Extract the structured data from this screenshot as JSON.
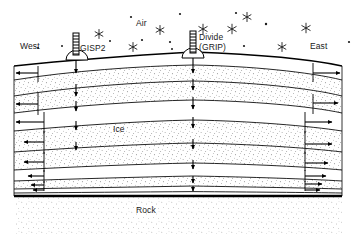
{
  "figure": {
    "kind": "glaciological-cross-section",
    "title_visible": false,
    "background_color": "#ffffff",
    "line_color": "#000000",
    "stipple_color": "#555555",
    "bed_color": "#000000",
    "width_px": 356,
    "height_px": 236
  },
  "labels": {
    "west": "West",
    "east": "East",
    "air": "Air",
    "ice": "Ice",
    "rock": "Rock",
    "gisp2": "GISP2",
    "divide_line1": "Divide",
    "divide_line2": "(GRIP)"
  },
  "drill_sites": [
    {
      "name": "GISP2",
      "label": "GISP2",
      "x": 76,
      "surface_y": 58,
      "mast_height": 22
    },
    {
      "name": "Divide (GRIP)",
      "label": "Divide\n(GRIP)",
      "x": 193,
      "surface_y": 56,
      "mast_height": 24
    }
  ],
  "chart_data": {
    "type": "diagram",
    "axes": {
      "horizontal": "West - East transect",
      "vertical": "Depth (ice thickness)"
    },
    "regions": [
      {
        "name": "Air",
        "label": "Air",
        "label_x": 143,
        "label_y": 24
      },
      {
        "name": "Ice",
        "label": "Ice",
        "label_x": 118,
        "label_y": 130
      },
      {
        "name": "Rock",
        "label": "Rock",
        "label_x": 140,
        "label_y": 211
      }
    ],
    "snowflakes": [
      {
        "x": 62,
        "y": 46,
        "size": 2.0,
        "style": "dot"
      },
      {
        "x": 99,
        "y": 34,
        "size": 4.5,
        "style": "star"
      },
      {
        "x": 131,
        "y": 17,
        "size": 2.2,
        "style": "dot"
      },
      {
        "x": 110,
        "y": 41,
        "size": 2.0,
        "style": "dot"
      },
      {
        "x": 142,
        "y": 40,
        "size": 2.2,
        "style": "dot"
      },
      {
        "x": 133,
        "y": 47,
        "size": 4.5,
        "style": "star"
      },
      {
        "x": 160,
        "y": 30,
        "size": 4.5,
        "style": "star"
      },
      {
        "x": 170,
        "y": 42,
        "size": 2.2,
        "style": "dot"
      },
      {
        "x": 172,
        "y": 49,
        "size": 2.0,
        "style": "dot"
      },
      {
        "x": 203,
        "y": 29,
        "size": 4.8,
        "style": "star"
      },
      {
        "x": 180,
        "y": 14,
        "size": 2.2,
        "style": "dot"
      },
      {
        "x": 232,
        "y": 29,
        "size": 4.8,
        "style": "star"
      },
      {
        "x": 236,
        "y": 13,
        "size": 2.2,
        "style": "dot"
      },
      {
        "x": 266,
        "y": 24,
        "size": 2.4,
        "style": "dot"
      },
      {
        "x": 244,
        "y": 46,
        "size": 2.2,
        "style": "dot"
      },
      {
        "x": 247,
        "y": 17,
        "size": 4.6,
        "style": "star"
      },
      {
        "x": 282,
        "y": 47,
        "size": 4.5,
        "style": "star"
      },
      {
        "x": 306,
        "y": 28,
        "size": 4.8,
        "style": "star"
      },
      {
        "x": 349,
        "y": 42,
        "size": 2.2,
        "style": "dot"
      },
      {
        "x": 38,
        "y": 48,
        "size": 2.2,
        "style": "dot"
      }
    ],
    "surface_profile": {
      "note": "Dome-shaped ice surface, highest at the divide",
      "points": [
        [
          14,
          66
        ],
        [
          60,
          60
        ],
        [
          110,
          56
        ],
        [
          160,
          53
        ],
        [
          193,
          52
        ],
        [
          240,
          54
        ],
        [
          290,
          58
        ],
        [
          342,
          66
        ]
      ]
    },
    "bed": {
      "note": "Flat bedrock interface drawn as a heavy black line",
      "y": 196,
      "x_start": 14,
      "x_end": 342
    },
    "isochrone_layers": [
      {
        "index": 1,
        "label": "layer-1",
        "left_y": 80,
        "mid_y": 70,
        "right_y": 80
      },
      {
        "index": 2,
        "label": "layer-2",
        "left_y": 95,
        "mid_y": 85,
        "right_y": 95
      },
      {
        "index": 3,
        "label": "layer-3",
        "left_y": 113,
        "mid_y": 106,
        "right_y": 112
      },
      {
        "index": 4,
        "label": "layer-4",
        "left_y": 131,
        "mid_y": 125,
        "right_y": 130
      },
      {
        "index": 5,
        "label": "layer-5",
        "left_y": 152,
        "mid_y": 147,
        "right_y": 151
      },
      {
        "index": 6,
        "label": "layer-6",
        "left_y": 170,
        "mid_y": 166,
        "right_y": 168
      },
      {
        "index": 7,
        "label": "layer-7",
        "left_y": 181,
        "mid_y": 178,
        "right_y": 179
      },
      {
        "index": 8,
        "label": "layer-8",
        "left_y": 189,
        "mid_y": 187,
        "right_y": 187
      },
      {
        "index": 9,
        "label": "layer-9",
        "left_y": 193,
        "mid_y": 192,
        "right_y": 192
      }
    ],
    "vertical_arrows": [
      {
        "site": "GISP2",
        "x": 76,
        "from_y": 60,
        "to_y": 72
      },
      {
        "site": "GISP2",
        "x": 76,
        "from_y": 83,
        "to_y": 95
      },
      {
        "site": "GISP2",
        "x": 76,
        "from_y": 100,
        "to_y": 110
      },
      {
        "site": "GISP2",
        "x": 76,
        "from_y": 121,
        "to_y": 129
      },
      {
        "site": "GISP2",
        "x": 76,
        "from_y": 142,
        "to_y": 149
      },
      {
        "site": "Divide",
        "x": 193,
        "from_y": 54,
        "to_y": 72
      },
      {
        "site": "Divide",
        "x": 193,
        "from_y": 78,
        "to_y": 90
      },
      {
        "site": "Divide",
        "x": 193,
        "from_y": 96,
        "to_y": 108
      },
      {
        "site": "Divide",
        "x": 193,
        "from_y": 116,
        "to_y": 127
      },
      {
        "site": "Divide",
        "x": 193,
        "from_y": 138,
        "to_y": 148
      },
      {
        "site": "Divide",
        "x": 193,
        "from_y": 160,
        "to_y": 168
      },
      {
        "site": "Divide",
        "x": 193,
        "from_y": 176,
        "to_y": 182
      },
      {
        "site": "Divide",
        "x": 193,
        "from_y": 186,
        "to_y": 190
      }
    ],
    "horizontal_arrows_left": [
      {
        "y": 73,
        "from_x": 38,
        "to_x": 14,
        "stem_x": 38,
        "stem_from_y": 66,
        "stem_to_y": 80
      },
      {
        "y": 104,
        "from_x": 38,
        "to_x": 14,
        "stem_x": 38,
        "stem_from_y": 93,
        "stem_to_y": 114
      },
      {
        "y": 122,
        "from_x": 44,
        "to_x": 14,
        "stem_x": 44,
        "stem_from_y": 113,
        "stem_to_y": 131
      },
      {
        "y": 142,
        "from_x": 44,
        "to_x": 22,
        "stem_x": 44,
        "stem_from_y": 132,
        "stem_to_y": 152
      },
      {
        "y": 162,
        "from_x": 44,
        "to_x": 22,
        "stem_x": 44,
        "stem_from_y": 153,
        "stem_to_y": 170
      },
      {
        "y": 176,
        "from_x": 44,
        "to_x": 26,
        "stem_x": 44,
        "stem_from_y": 171,
        "stem_to_y": 181
      },
      {
        "y": 185,
        "from_x": 44,
        "to_x": 30,
        "stem_x": 44,
        "stem_from_y": 182,
        "stem_to_y": 190
      },
      {
        "y": 190,
        "from_x": 44,
        "to_x": 32,
        "stem_x": 44,
        "stem_from_y": 188,
        "stem_to_y": 193
      }
    ],
    "horizontal_arrows_right": [
      {
        "y": 73,
        "from_x": 313,
        "to_x": 342,
        "stem_x": 313,
        "stem_from_y": 63,
        "stem_to_y": 80
      },
      {
        "y": 103,
        "from_x": 313,
        "to_x": 336,
        "stem_x": 313,
        "stem_from_y": 95,
        "stem_to_y": 112
      },
      {
        "y": 122,
        "from_x": 305,
        "to_x": 330,
        "stem_x": 305,
        "stem_from_y": 113,
        "stem_to_y": 130
      },
      {
        "y": 144,
        "from_x": 305,
        "to_x": 330,
        "stem_x": 305,
        "stem_from_y": 132,
        "stem_to_y": 152
      },
      {
        "y": 163,
        "from_x": 305,
        "to_x": 326,
        "stem_x": 305,
        "stem_from_y": 154,
        "stem_to_y": 169
      },
      {
        "y": 176,
        "from_x": 305,
        "to_x": 324,
        "stem_x": 305,
        "stem_from_y": 170,
        "stem_to_y": 180
      },
      {
        "y": 184,
        "from_x": 305,
        "to_x": 320,
        "stem_x": 305,
        "stem_from_y": 181,
        "stem_to_y": 188
      },
      {
        "y": 190,
        "from_x": 305,
        "to_x": 318,
        "stem_x": 305,
        "stem_from_y": 188,
        "stem_to_y": 193
      }
    ],
    "legend": {
      "present": false,
      "entries": []
    },
    "grid": false
  }
}
